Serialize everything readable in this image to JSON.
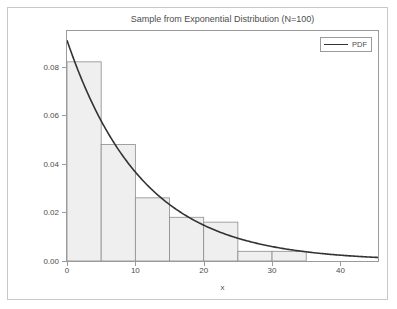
{
  "figure": {
    "title": "Sample from Exponential Distribution (N=100)",
    "xlabel": "x",
    "ylabel": "Density",
    "background_color": "#ffffff",
    "border_color": "#c8c8c8",
    "axis_color": "#9a9a9a",
    "text_color": "#4d4d4d"
  },
  "legend": {
    "position": "upper-right",
    "entries": [
      {
        "label": "PDF",
        "marker": "line",
        "color": "#333333"
      }
    ]
  },
  "axes": {
    "x": {
      "label": "x",
      "min": 0,
      "max": 45.5,
      "ticks": [
        0,
        10,
        20,
        30,
        40
      ],
      "tick_labels": [
        "0",
        "10",
        "20",
        "30",
        "40"
      ]
    },
    "y": {
      "label": "Density",
      "min": 0,
      "max": 0.0947,
      "ticks": [
        0.0,
        0.02,
        0.04,
        0.06,
        0.08
      ],
      "tick_labels": [
        "0.00",
        "0.02",
        "0.04",
        "0.06",
        "0.08"
      ]
    }
  },
  "chart_data": {
    "type": "bar",
    "title": "Sample from Exponential Distribution (N=100)",
    "xlabel": "x",
    "ylabel": "Density",
    "xlim": [
      0,
      45.5
    ],
    "ylim": [
      0,
      0.0947
    ],
    "grid": false,
    "legend_position": "upper right",
    "sample_size": 100,
    "bin_width": 5,
    "bin_edges": [
      0,
      5,
      10,
      15,
      20,
      25,
      30,
      35,
      40,
      45
    ],
    "categories": [
      "0-5",
      "5-10",
      "10-15",
      "15-20",
      "20-25",
      "25-30",
      "30-35",
      "35-40",
      "40-45"
    ],
    "values": [
      0.082,
      0.048,
      0.026,
      0.018,
      0.016,
      0.004,
      0.004,
      0.0,
      0.0
    ],
    "bar_face_color": "#efefef",
    "bar_edge_color": "#8c8c8c",
    "series": [
      {
        "name": "PDF",
        "type": "line",
        "color": "#333333",
        "distribution": "exponential",
        "rate_lambda": 0.0909,
        "mean": 11.0,
        "x": [
          0,
          2.5,
          5,
          7.5,
          10,
          12.5,
          15,
          17.5,
          20,
          22.5,
          25,
          27.5,
          30,
          32.5,
          35,
          37.5,
          40,
          42.5,
          45
        ],
        "y": [
          0.0909,
          0.0724,
          0.0577,
          0.046,
          0.0366,
          0.0292,
          0.0233,
          0.0185,
          0.0148,
          0.0118,
          0.0094,
          0.0075,
          0.0059,
          0.0047,
          0.0038,
          0.003,
          0.0024,
          0.0019,
          0.0015
        ]
      }
    ]
  }
}
